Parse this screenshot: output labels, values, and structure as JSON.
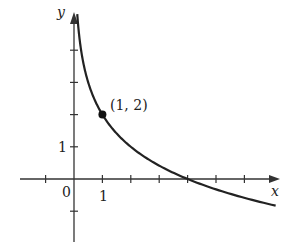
{
  "chart_data": {
    "type": "line",
    "title": "",
    "xlabel": "x",
    "ylabel": "y",
    "function": "y = 2 - log2(x)",
    "x_ticks": [
      -1,
      0,
      1,
      2,
      3,
      4,
      5,
      6
    ],
    "y_ticks": [
      -1,
      0,
      1,
      2,
      3,
      4
    ],
    "tick_labels": {
      "x": [
        "0",
        "1"
      ],
      "y": [
        "1"
      ]
    },
    "xlim": [
      -1.9,
      7.2
    ],
    "ylim": [
      -1.9,
      5.2
    ],
    "grid": false,
    "series": [
      {
        "name": "curve",
        "x": [
          0.125,
          0.25,
          0.5,
          1,
          2,
          3,
          4,
          5,
          6,
          7
        ],
        "y": [
          5,
          4,
          3,
          2,
          1,
          0.415,
          0,
          -0.32,
          -0.585,
          -0.81
        ]
      }
    ],
    "annotations": [
      {
        "label": "(1, 2)",
        "x": 1,
        "y": 2,
        "marker": "filled-dot"
      }
    ],
    "x_intercept": 4,
    "colors": {
      "axis": "#333333",
      "curve": "#222222",
      "background": "#ffffff"
    }
  },
  "labels": {
    "x_axis": "x",
    "y_axis": "y",
    "origin": "0",
    "x_one": "1",
    "y_one": "1",
    "point": "(1, 2)"
  }
}
